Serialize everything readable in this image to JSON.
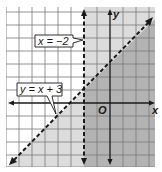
{
  "diagram": {
    "type": "coordinate-plane-inequalities",
    "grid": {
      "x_min": -8,
      "x_max": 3.5,
      "y_min": -5,
      "y_max": 7.5,
      "unit": 1
    },
    "axes": {
      "x_label": "x",
      "y_label": "y",
      "origin_label": "O"
    },
    "boundaries": [
      {
        "equation_label": "x = −2",
        "style": "dashed",
        "type": "vertical",
        "x": -2
      },
      {
        "equation_label": "y = x + 3",
        "style": "dashed",
        "type": "line",
        "slope": 1,
        "intercept": 3
      }
    ],
    "shading": {
      "light": "#dcdcdc",
      "dark": "#b3b3b3",
      "description": "Region x > -2 and region y < x + 3 shaded; overlap darker"
    }
  },
  "labels": {
    "line1": "x = −2",
    "line2": "y = x + 3",
    "x_axis": "x",
    "y_axis": "y",
    "origin": "O"
  }
}
